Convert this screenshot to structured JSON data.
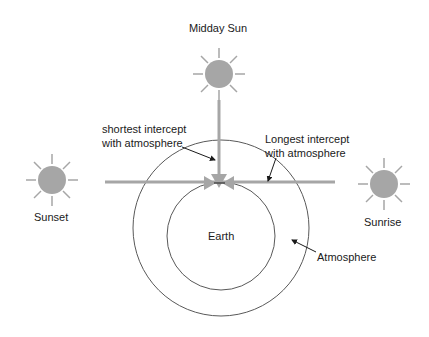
{
  "diagram": {
    "suns": {
      "midday": {
        "label": "Midday Sun"
      },
      "sunset": {
        "label": "Sunset"
      },
      "sunrise": {
        "label": "Sunrise"
      }
    },
    "bodies": {
      "earth": {
        "label": "Earth"
      },
      "atmosphere": {
        "label": "Atmosphere"
      }
    },
    "annotations": {
      "shortest_line1": "shortest intercept",
      "shortest_line2": "with atmosphere",
      "longest_line1": "Longest intercept",
      "longest_line2": "with atmosphere"
    },
    "colors": {
      "sun": "#a6a6a6",
      "ray_line": "#a6a6a6",
      "circle_stroke": "#595959",
      "text": "#1a1a1a"
    }
  }
}
